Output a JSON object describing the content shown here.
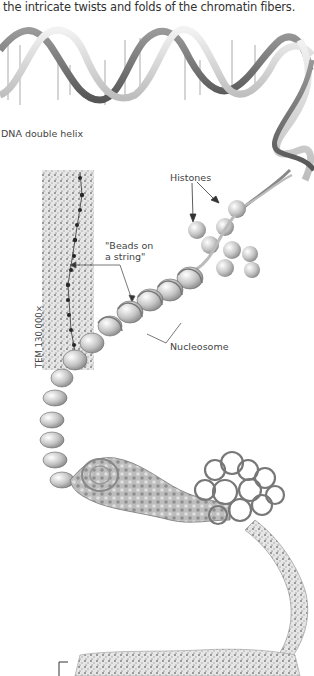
{
  "caption": "the intricate twists and folds of the chromatin fibers.",
  "labels": {
    "dna_double_helix": "DNA double helix",
    "histones": "Histones",
    "beads_on_a_string_line1": "\"Beads on",
    "beads_on_a_string_line2": "a string\"",
    "nucleosome": "Nucleosome",
    "tem": "TEM 130,000×"
  },
  "colors": {
    "background": "#ffffff",
    "text": "#444444",
    "strand_dark": "#6b6b6b",
    "strand_light": "#d9d9d9",
    "histone": "#c8c8c8"
  }
}
